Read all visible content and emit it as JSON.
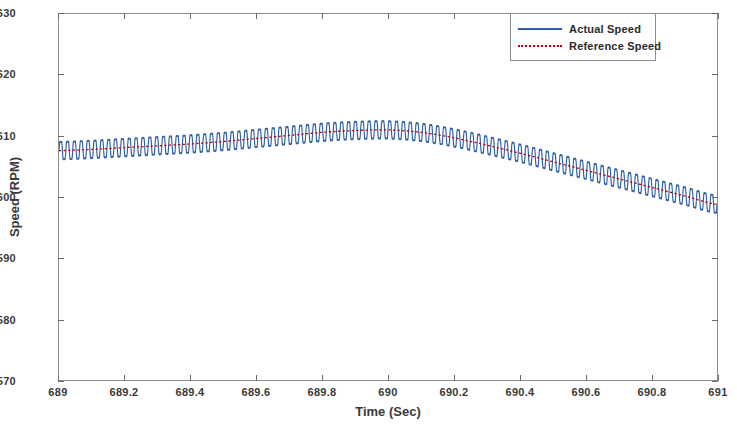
{
  "chart_data": {
    "type": "line",
    "title": "",
    "xlabel": "Time (Sec)",
    "ylabel": "Speed (RPM)",
    "xlim": [
      689,
      691
    ],
    "ylim": [
      1570,
      1630
    ],
    "xticks": [
      "689",
      "689.2",
      "689.4",
      "689.6",
      "689.8",
      "690",
      "690.2",
      "690.4",
      "690.6",
      "690.8",
      "691"
    ],
    "xtick_values": [
      689,
      689.2,
      689.4,
      689.6,
      689.8,
      690,
      690.2,
      690.4,
      690.6,
      690.8,
      691
    ],
    "yticks": [
      "1570",
      "1580",
      "1590",
      "1600",
      "1610",
      "1620",
      "1630"
    ],
    "ytick_values": [
      1570,
      1580,
      1590,
      1600,
      1610,
      1620,
      1630
    ],
    "grid": false,
    "legend_position": "top-right",
    "series": [
      {
        "name": "Actual Speed",
        "color": "#2e5fa3",
        "style": "solid",
        "linewidth": 1.2,
        "description": "High-frequency ripple oscillating about the reference speed, peak-to-peak amplitude approximately 4 RPM",
        "ripple_amplitude_rpm": 2.1,
        "ripple_cycles": 96
      },
      {
        "name": "Reference Speed",
        "color": "#c00000",
        "style": "dotted",
        "linewidth": 1.2,
        "description": "Smooth mean trajectory: slowly rising to a peak near t=690 s then decreasing",
        "x": [
          689.0,
          689.1,
          689.2,
          689.3,
          689.4,
          689.5,
          689.6,
          689.7,
          689.8,
          689.9,
          690.0,
          690.1,
          690.2,
          690.3,
          690.4,
          690.5,
          690.6,
          690.7,
          690.8,
          690.9,
          691.0
        ],
        "y": [
          1607.6,
          1607.8,
          1608.1,
          1608.4,
          1608.7,
          1609.1,
          1609.6,
          1610.1,
          1610.6,
          1610.9,
          1611.0,
          1610.6,
          1609.7,
          1608.5,
          1607.2,
          1605.8,
          1604.4,
          1603.0,
          1601.6,
          1600.2,
          1598.8
        ]
      }
    ]
  },
  "legend": {
    "items": [
      {
        "label": "Actual Speed",
        "swatch": "solid-line-swatch"
      },
      {
        "label": "Reference Speed",
        "swatch": "dotted-line-swatch"
      }
    ]
  },
  "axes": {
    "x_title": "Time (Sec)",
    "y_title": "Speed (RPM)"
  },
  "colors": {
    "actual": "#2e5fa3",
    "reference": "#c00000",
    "frame": "#8d8d8d",
    "text": "#3a3a3a",
    "background": "#ffffff"
  }
}
